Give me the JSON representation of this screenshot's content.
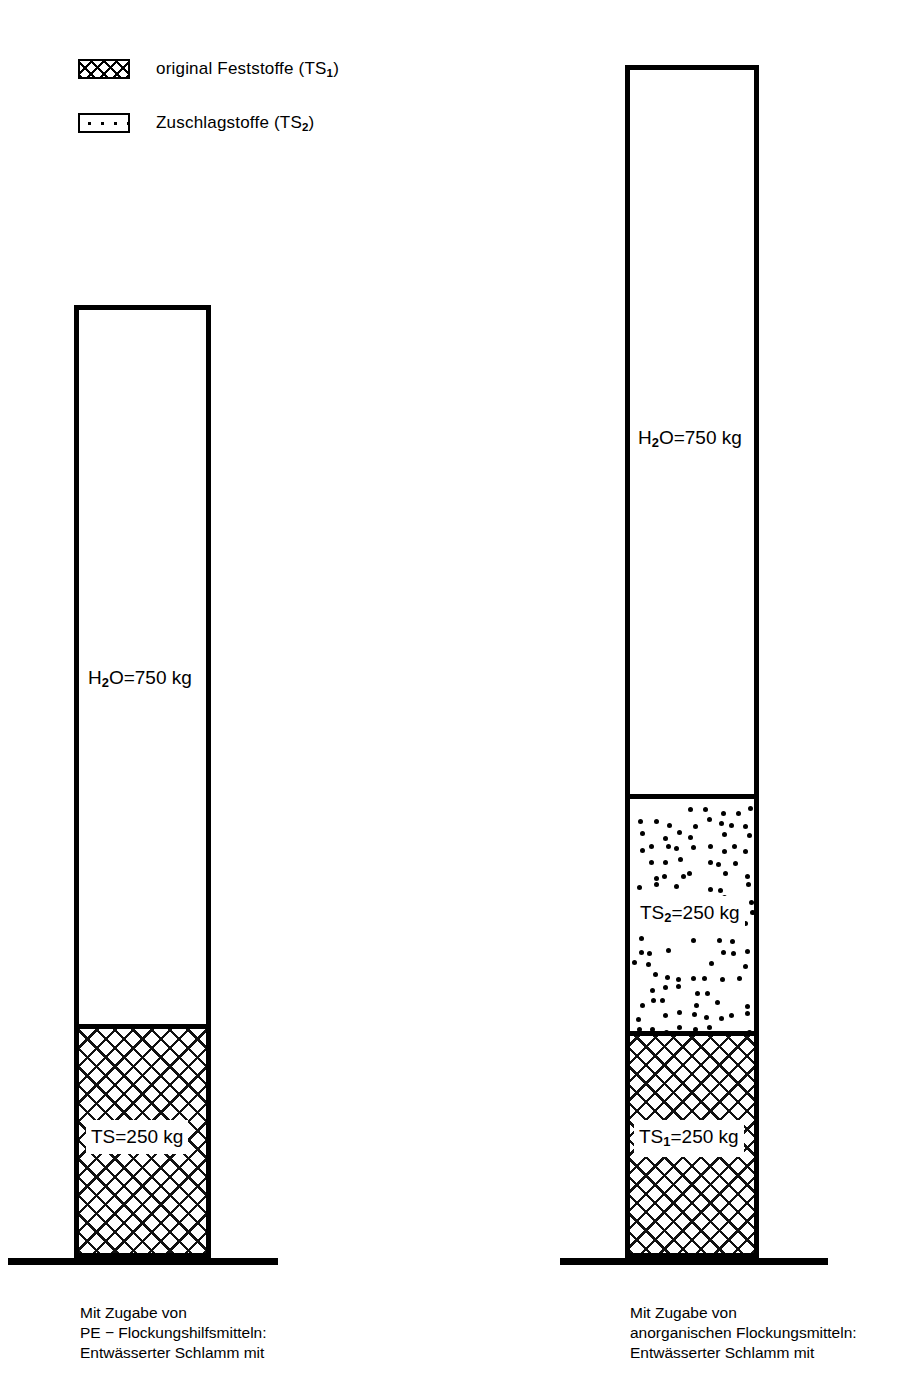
{
  "legend": {
    "items": [
      {
        "swatch": "cross-hatch-pattern",
        "label_html": "original Feststoffe (TS₁)",
        "label": "original Feststoffe (TS1)"
      },
      {
        "swatch": "dot-stipple-pattern",
        "label_html": "Zuschlagstoffe (TS₂)",
        "label": "Zuschlagstoffe (TS2)"
      }
    ]
  },
  "columns": [
    {
      "id": "left-column",
      "bands": [
        {
          "id": "water",
          "label": "H2O=750 kg",
          "value": 750,
          "unit": "kg",
          "substance": "H2O",
          "fill": "none"
        },
        {
          "id": "solids",
          "label": "TS=250 kg",
          "value": 250,
          "unit": "kg",
          "substance": "TS",
          "fill": "cross-hatch"
        }
      ],
      "caption": "Mit Zugabe von\nPE − Flockungshilfsmitteln:\nEntwässerter Schlamm mit"
    },
    {
      "id": "right-column",
      "bands": [
        {
          "id": "water",
          "label": "H2O=750 kg",
          "value": 750,
          "unit": "kg",
          "substance": "H2O",
          "fill": "none"
        },
        {
          "id": "additives",
          "label": "TS2=250 kg",
          "value": 250,
          "unit": "kg",
          "substance": "TS2",
          "fill": "dot-stipple"
        },
        {
          "id": "solids",
          "label": "TS1=250 kg",
          "value": 250,
          "unit": "kg",
          "substance": "TS1",
          "fill": "cross-hatch"
        }
      ],
      "caption": "Mit Zugabe von\nanorganischen Flockungsmitteln:\nEntwässerter Schlamm mit"
    }
  ],
  "chart_data": {
    "type": "bar",
    "title": "",
    "xlabel": "",
    "ylabel": "Masse (kg)",
    "categories": [
      "Mit Zugabe von PE − Flockungshilfsmitteln",
      "Mit Zugabe von anorganischen Flockungsmitteln"
    ],
    "series": [
      {
        "name": "original Feststoffe (TS1)",
        "values": [
          250,
          250
        ],
        "pattern": "cross-hatch"
      },
      {
        "name": "Zuschlagstoffe (TS2)",
        "values": [
          0,
          250
        ],
        "pattern": "dot-stipple"
      },
      {
        "name": "H2O",
        "values": [
          750,
          750
        ],
        "pattern": "none"
      }
    ],
    "totals": [
      1000,
      1250
    ],
    "ylim": [
      0,
      1250
    ],
    "grid": false,
    "legend_position": "top-left",
    "stacked": true
  }
}
